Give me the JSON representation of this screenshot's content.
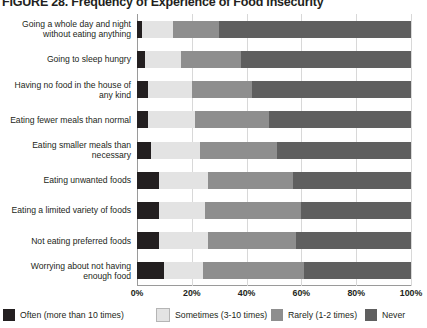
{
  "figure": {
    "title": "FIGURE 28. Frequency of Experience of Food Insecurity"
  },
  "chart_data": {
    "type": "bar",
    "orientation": "horizontal",
    "stacked": true,
    "normalized_percent": true,
    "title": "FIGURE 28. Frequency of Experience of Food Insecurity",
    "xlabel": "",
    "ylabel": "",
    "xlim": [
      0,
      100
    ],
    "xticks": [
      "0%",
      "20%",
      "40%",
      "60%",
      "80%",
      "100%"
    ],
    "xtick_values": [
      0,
      20,
      40,
      60,
      80,
      100
    ],
    "grid": true,
    "legend_position": "bottom",
    "categories": [
      "Going a whole day and night without eating anything",
      "Going to sleep hungry",
      "Having no food in the house of any kind",
      "Eating fewer meals than normal",
      "Eating smaller meals than necessary",
      "Eating unwanted foods",
      "Eating a limited variety of foods",
      "Not eating preferred foods",
      "Worrying about not having enough food"
    ],
    "series": [
      {
        "name": "Often (more than 10 times)",
        "color": "#231f20",
        "values": [
          2,
          3,
          4,
          4,
          5,
          8,
          8,
          8,
          10
        ]
      },
      {
        "name": "Sometimes (3-10 times)",
        "color": "#e3e3e3",
        "values": [
          11,
          13,
          16,
          17,
          18,
          18,
          17,
          18,
          14
        ]
      },
      {
        "name": "Rarely (1-2 times)",
        "color": "#8e8e8e",
        "values": [
          17,
          22,
          22,
          27,
          28,
          31,
          35,
          32,
          37
        ]
      },
      {
        "name": "Never",
        "color": "#5f5f5f",
        "values": [
          70,
          62,
          58,
          52,
          49,
          43,
          40,
          42,
          39
        ]
      }
    ]
  },
  "axis": {
    "tick_labels": [
      "0%",
      "20%",
      "40%",
      "60%",
      "80%",
      "100%"
    ]
  },
  "legend": {
    "items": [
      {
        "label": "Often (more than 10 times)",
        "color": "#231f20"
      },
      {
        "label": "Sometimes (3-10 times)",
        "color": "#e3e3e3"
      },
      {
        "label": "Rarely (1-2 times)",
        "color": "#8e8e8e"
      },
      {
        "label": "Never",
        "color": "#5f5f5f"
      }
    ]
  }
}
